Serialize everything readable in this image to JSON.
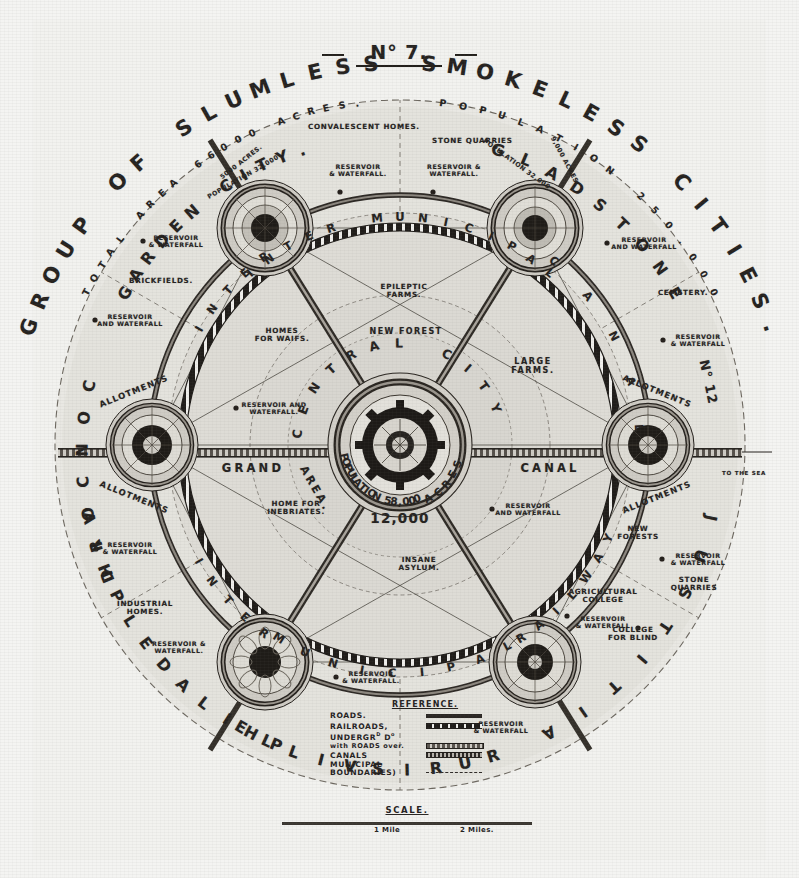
{
  "plate": {
    "number": "N° 7.",
    "title": "GROUP OF SLUMLESS SMOKELESS CITIES.",
    "total_area": "TOTAL AREA 66000 ACRES.",
    "population": "POPULATION 250.000"
  },
  "central_city": {
    "name": "CENTRAL CITY",
    "population": "POPULATION 58,000",
    "acres_label": "ACRES",
    "acres_value": "12,000",
    "grand_area": "GRAND AREA"
  },
  "cities": [
    {
      "id": "garden-city",
      "name": "GARDEN CITY.",
      "acres": "5000 ACRES.",
      "population": "POPULATION 32.000"
    },
    {
      "id": "gladstone",
      "name": "GLADSTONE",
      "acres": "9,000 ACRES",
      "population": "POPULATION 32,000"
    },
    {
      "id": "justitia",
      "name": "JUSTITIA",
      "number": "N° 12"
    },
    {
      "id": "rurisville",
      "name": "RURISVILLE"
    },
    {
      "id": "philadelphia",
      "name": "PHILADELPHIA"
    },
    {
      "id": "concord",
      "name": "CONCORD"
    }
  ],
  "rings": {
    "inter_municipal_top": "INTER MUNICIPAL",
    "inter_bottom_left": "INTER",
    "municipal_bottom": "MUNICIPAL",
    "railway_bottom": "RAILWAY",
    "inter_left": "INTER",
    "canal_right": "CANAL",
    "canal_mid_right": "CANAL",
    "grand_left": "GRAND"
  },
  "features": {
    "convalescent_homes": "CONVALESCENT HOMES.",
    "stone_quarries_top": "STONE QUARRIES",
    "brickfields": "BRICKFIELDS.",
    "cemetery": "CEMETERY.",
    "epileptic_farms": "EPILEPTIC FARMS.",
    "new_forest": "NEW FOREST",
    "homes_for_waifs": "HOMES FOR WAIFS.",
    "large_farms": "LARGE FARMS.",
    "home_for_inebriates": "HOME FOR INEBRIATES.",
    "insane_asylum": "INSANE ASYLUM.",
    "industrial_homes": "INDUSTRIAL HOMES.",
    "agricultural_college": "AGRICULTURAL COLLEGE",
    "college_for_blind": "COLLEGE FOR BLIND",
    "new_forests": "NEW FORESTS",
    "stone_quarries_right": "STONE QUARRIES",
    "allotments": "ALLOTMENTS",
    "to_the_sea": "TO THE SEA"
  },
  "reservoirs": [
    {
      "id": "res-gc-top",
      "line1": "RESERVOIR",
      "line2": "& WATERFALL."
    },
    {
      "id": "res-gc-left",
      "line1": "RESERVOIR",
      "line2": "& WATERFALL"
    },
    {
      "id": "res-conc-up",
      "line1": "RESERVOIR",
      "line2": "AND WATERFALL"
    },
    {
      "id": "res-conc-dn",
      "line1": "RESERVOIR",
      "line2": "& WATERFALL"
    },
    {
      "id": "res-gl-left",
      "line1": "RESERVOIR &",
      "line2": "WATERFALL."
    },
    {
      "id": "res-gl-right",
      "line1": "RESERVOIR",
      "line2": "AND WATERFALL"
    },
    {
      "id": "res-just-up",
      "line1": "RESERVOIR",
      "line2": "& WATERFALL"
    },
    {
      "id": "res-just-dn",
      "line1": "RESERVOIR",
      "line2": "& WATERFALL"
    },
    {
      "id": "res-centre-l",
      "line1": "RESERVOIR AND",
      "line2": "WATERFALL."
    },
    {
      "id": "res-centre-r",
      "line1": "RESERVOIR",
      "line2": "AND WATERFALL"
    },
    {
      "id": "res-phil",
      "line1": "RESERVOIR &",
      "line2": "WATERFALL."
    },
    {
      "id": "res-phil-r",
      "line1": "RESERVOIR",
      "line2": "& WATERFALL."
    },
    {
      "id": "res-ruri-l",
      "line1": "RESERVOIR",
      "line2": "& WATERFALL"
    },
    {
      "id": "res-ruri-r",
      "line1": "RESERVOIR",
      "line2": "& WATERFALL"
    }
  ],
  "reference": {
    "title": "REFERENCE.",
    "items": [
      {
        "label": "ROADS.",
        "key": "road"
      },
      {
        "label": "RAILROADS,",
        "key": "rail"
      },
      {
        "label": "UNDERGRᵈ Dº with ROADS over.",
        "key": "under"
      },
      {
        "label": "CANALS",
        "key": "canal"
      },
      {
        "label": "MUNICIPAL BOUNDARIES)",
        "key": "bound"
      }
    ]
  },
  "scale": {
    "title": "SCALE.",
    "tick1": "1 Mile",
    "tick2": "2 Miles."
  },
  "colors": {
    "paper": "#f2f2ef",
    "ink": "#25221f",
    "land_fill": "#d9d7d1",
    "road": "#2b2724"
  }
}
